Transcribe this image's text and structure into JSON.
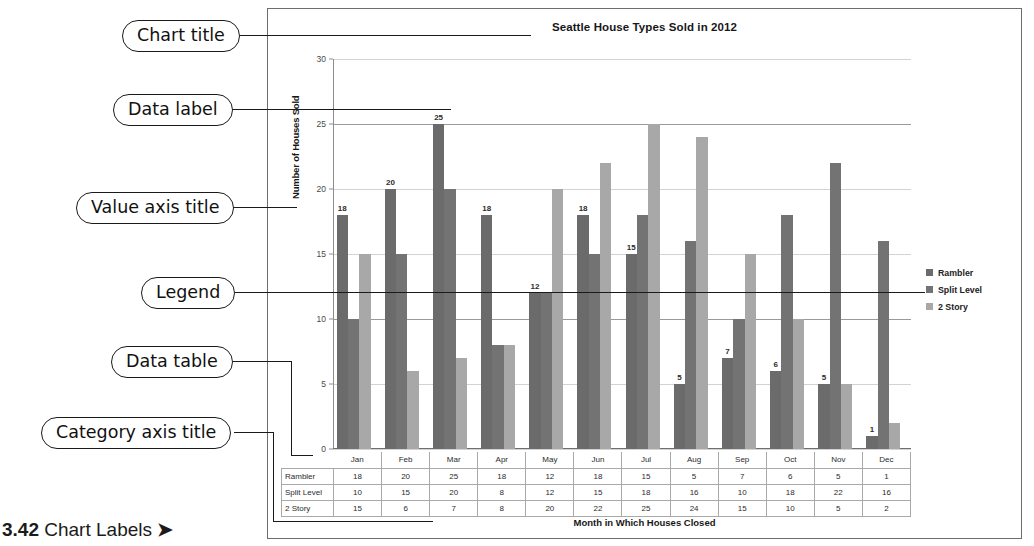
{
  "caption": {
    "number": "3.42",
    "text": "Chart Labels",
    "arrow": "➤"
  },
  "callouts": [
    {
      "id": "chart-title",
      "label": "Chart title"
    },
    {
      "id": "data-label",
      "label": "Data label"
    },
    {
      "id": "value-axis-title",
      "label": "Value axis title"
    },
    {
      "id": "legend",
      "label": "Legend"
    },
    {
      "id": "data-table",
      "label": "Data table"
    },
    {
      "id": "category-axis-title",
      "label": "Category axis title"
    }
  ],
  "chart_data": {
    "type": "bar",
    "title": "Seattle House Types Sold in 2012",
    "xlabel": "Month in Which Houses Closed",
    "ylabel": "Number of Houses Sold",
    "ylim": [
      0,
      30
    ],
    "yticks": [
      0,
      5,
      10,
      15,
      20,
      25,
      30
    ],
    "grid": true,
    "legend_position": "right",
    "data_labels_series": "Rambler",
    "categories": [
      "Jan",
      "Feb",
      "Mar",
      "Apr",
      "May",
      "Jun",
      "Jul",
      "Aug",
      "Sep",
      "Oct",
      "Nov",
      "Dec"
    ],
    "series": [
      {
        "name": "Rambler",
        "color": "#6b6b6b",
        "values": [
          18,
          20,
          25,
          18,
          12,
          18,
          15,
          5,
          7,
          6,
          5,
          1
        ]
      },
      {
        "name": "Split Level",
        "color": "#737373",
        "values": [
          10,
          15,
          20,
          8,
          12,
          15,
          18,
          16,
          10,
          18,
          22,
          16
        ]
      },
      {
        "name": "2 Story",
        "color": "#a8a8a8",
        "values": [
          15,
          6,
          7,
          8,
          20,
          22,
          25,
          24,
          15,
          10,
          5,
          2
        ]
      }
    ]
  },
  "data_table": {
    "corner": "",
    "columns": [
      "Jan",
      "Feb",
      "Mar",
      "Apr",
      "May",
      "Jun",
      "Jul",
      "Aug",
      "Sep",
      "Oct",
      "Nov",
      "Dec"
    ],
    "rows": [
      {
        "label": "Rambler",
        "values": [
          "18",
          "20",
          "25",
          "18",
          "12",
          "18",
          "15",
          "5",
          "7",
          "6",
          "5",
          "1"
        ]
      },
      {
        "label": "Split Level",
        "values": [
          "10",
          "15",
          "20",
          "8",
          "12",
          "15",
          "18",
          "16",
          "10",
          "18",
          "22",
          "16"
        ]
      },
      {
        "label": "2 Story",
        "values": [
          "15",
          "6",
          "7",
          "8",
          "20",
          "22",
          "25",
          "24",
          "15",
          "10",
          "5",
          "2"
        ]
      }
    ]
  }
}
